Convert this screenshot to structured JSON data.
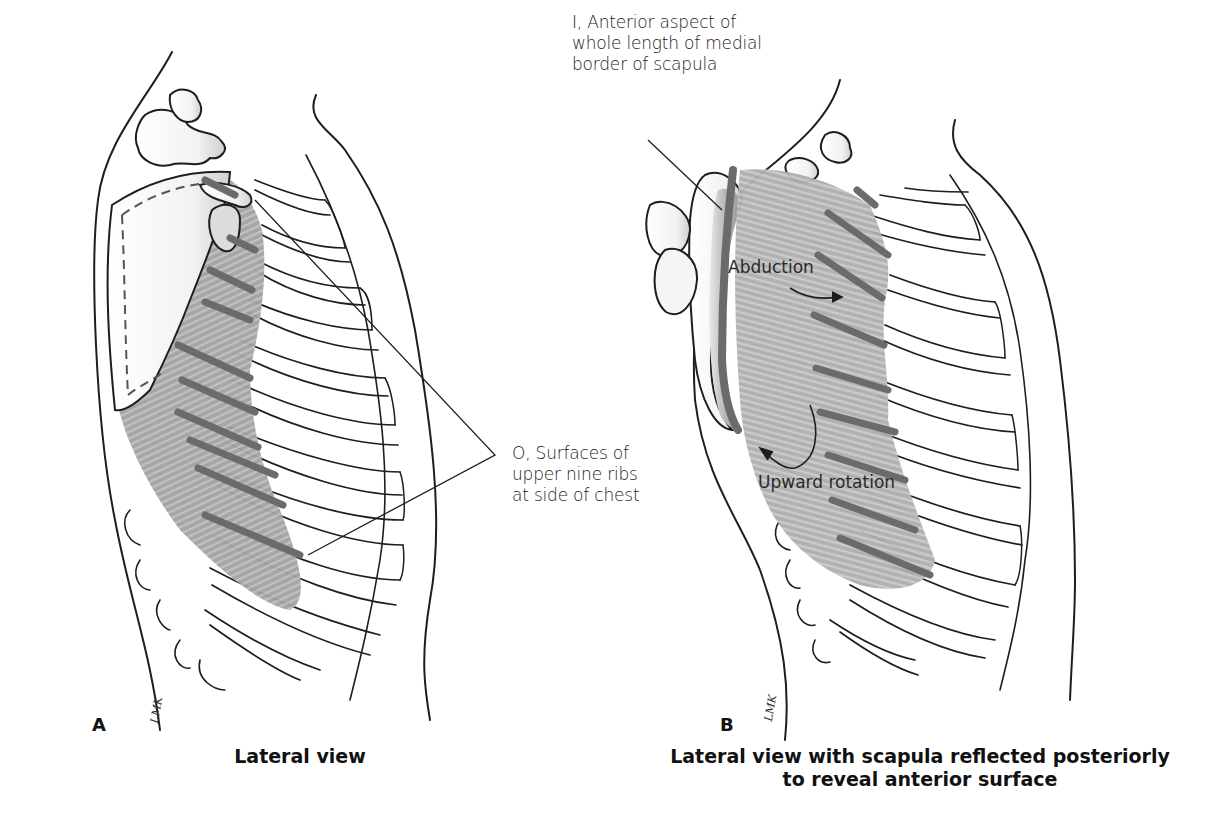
{
  "figure": {
    "colors": {
      "outline": "#1e1e1e",
      "muscle_fill": "#a9a9a9",
      "muscle_fiber": "#cfcfcf",
      "attachment_marks": "#6b6b6b",
      "bone_shade": "#d8d8d8",
      "background": "#ffffff"
    }
  },
  "labels": {
    "insertion": {
      "lines": [
        "I, Anterior aspect of",
        "whole length of medial",
        "border of scapula"
      ]
    },
    "origin": {
      "lines": [
        "O, Surfaces of",
        "upper nine ribs",
        "at side of chest"
      ]
    },
    "abduction": "Abduction",
    "upward_rotation": "Upward rotation"
  },
  "panels": [
    {
      "letter": "A",
      "caption_lines": [
        "Lateral view"
      ],
      "signature": "LMK"
    },
    {
      "letter": "B",
      "caption_lines": [
        "Lateral view with scapula reflected posteriorly",
        "to reveal anterior surface"
      ],
      "signature": "LMK"
    }
  ]
}
